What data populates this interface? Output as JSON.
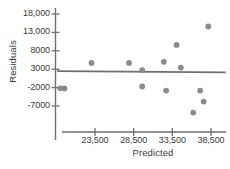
{
  "chart_data": {
    "type": "scatter",
    "title": "",
    "xlabel": "Predicted",
    "ylabel": "Residuals",
    "grid": false,
    "legend": null,
    "xlim": [
      18500,
      40500
    ],
    "ylim": [
      -10500,
      19000
    ],
    "xticks": [
      23500,
      28500,
      33500,
      38500
    ],
    "xtick_labels": [
      "23,500",
      "28,500",
      "33,500",
      "38,500"
    ],
    "yticks": [
      18000,
      13000,
      8000,
      3000,
      -2000,
      -7000
    ],
    "ytick_labels": [
      "18,000",
      "13,000",
      "8000",
      "3000",
      "-2000",
      "-7000"
    ],
    "series": [
      {
        "name": "residuals",
        "marker": "circle",
        "color": "#8b8b8b",
        "points": [
          {
            "x": 19000,
            "y": -2200
          },
          {
            "x": 19550,
            "y": -2250
          },
          {
            "x": 23050,
            "y": 4700
          },
          {
            "x": 27900,
            "y": 4700
          },
          {
            "x": 29600,
            "y": 2750
          },
          {
            "x": 29600,
            "y": -1700
          },
          {
            "x": 32400,
            "y": 5000
          },
          {
            "x": 32700,
            "y": -2800
          },
          {
            "x": 34050,
            "y": 9600
          },
          {
            "x": 34600,
            "y": 3450
          },
          {
            "x": 36200,
            "y": -8800
          },
          {
            "x": 37100,
            "y": -2800
          },
          {
            "x": 37550,
            "y": -5800
          },
          {
            "x": 38150,
            "y": 14600
          }
        ]
      }
    ],
    "fit_line": {
      "name": "zero-trend-line",
      "color": "#6e6e6e",
      "x_start": 18600,
      "y_start": 2450,
      "x_end": 40400,
      "y_end": 2150
    }
  }
}
